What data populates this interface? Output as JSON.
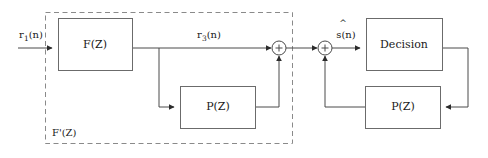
{
  "diagram": {
    "canvas": {
      "width": 488,
      "height": 158
    },
    "colors": {
      "background": "#ffffff",
      "wire": "#4a4a4a",
      "box_border": "#6b6b6b",
      "dashed_border": "#8a8a8a",
      "text": "#1a1a1a",
      "arrowhead": "#2b2b2b"
    },
    "blocks": {
      "feedforward_filter": {
        "label": "F(Z)",
        "x": 58,
        "y": 18,
        "w": 74,
        "h": 52
      },
      "feedback_filter_left": {
        "label": "P(Z)",
        "x": 180,
        "y": 86,
        "w": 75,
        "h": 42
      },
      "decision": {
        "label": "Decision",
        "x": 366,
        "y": 18,
        "w": 76,
        "h": 52
      },
      "feedback_filter_right": {
        "label": "P(Z)",
        "x": 365,
        "y": 86,
        "w": 75,
        "h": 42
      }
    },
    "group_box": {
      "label": "F'(Z)",
      "label_prefix": "F",
      "label_prime": "'",
      "label_suffix": "(Z)",
      "x": 45,
      "y": 12,
      "w": 247,
      "h": 132
    },
    "summing_junctions": [
      {
        "name": "adder-1",
        "symbol": "+",
        "cx": 279,
        "cy": 48,
        "r": 7
      },
      {
        "name": "adder-2",
        "symbol": "+",
        "cx": 325,
        "cy": 48,
        "r": 7
      }
    ],
    "signals": {
      "input": {
        "base": "r",
        "subscript": "1",
        "suffix": "(n)",
        "text": "r1(n)"
      },
      "mid": {
        "base": "r",
        "subscript": "3",
        "suffix": "(n)",
        "text": "r3(n)"
      },
      "estimate": {
        "base": "s",
        "hat": "^",
        "suffix": "(n)",
        "text": "s(n)"
      }
    }
  }
}
